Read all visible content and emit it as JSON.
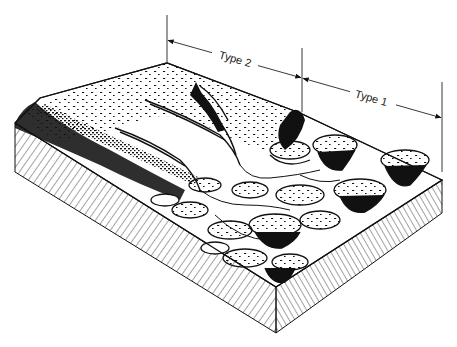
{
  "diagram": {
    "type": "block-diagram",
    "colors": {
      "ink": "#111111",
      "background": "#ffffff",
      "hatch": "#333333"
    },
    "dimensions": [
      {
        "label": "Type 2",
        "from": [
          167,
          40
        ],
        "to": [
          302,
          78
        ],
        "label_position": [
          236,
          58
        ]
      },
      {
        "label": "Type 1",
        "from": [
          302,
          78
        ],
        "to": [
          442,
          118
        ],
        "label_position": [
          372,
          97
        ]
      }
    ],
    "extension_lines": [
      {
        "x": 167,
        "y1": 15,
        "y2": 62
      },
      {
        "x": 302,
        "y1": 48,
        "y2": 112
      },
      {
        "x": 442,
        "y1": 82,
        "y2": 172
      }
    ]
  }
}
